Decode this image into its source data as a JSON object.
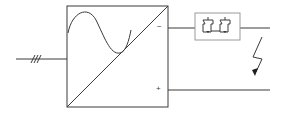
{
  "diagram": {
    "input": {
      "phases_marker": "///",
      "phase_count": 3
    },
    "converter_block": {
      "symbol": "sine-to-dc",
      "terminals": {
        "negative": "−",
        "positive": "+"
      }
    },
    "filter_block": {
      "elements": [
        "switch",
        "switch"
      ]
    },
    "fault_symbol": "lightning-arrow",
    "colors": {
      "line": "#3a3a3a",
      "filter_border": "#9a9a9a",
      "background": "#ffffff"
    }
  }
}
